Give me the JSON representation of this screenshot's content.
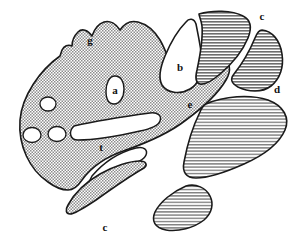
{
  "figure": {
    "background_color": "#ffffff",
    "outline_color": "#1a1a1a",
    "fill_light": "#b9b9b9",
    "fill_dark": "#9a9a9a",
    "label_color": "#111111",
    "width": 304,
    "height": 241
  },
  "labels": [
    {
      "id": "g",
      "text": "g",
      "x": 90,
      "y": 41,
      "note": "upper-left serrated margin"
    },
    {
      "id": "a",
      "text": "a",
      "x": 115,
      "y": 91,
      "note": "small pear-shaped lacuna in main body"
    },
    {
      "id": "b",
      "text": "b",
      "x": 180,
      "y": 68,
      "note": "large comma-shaped notch upper centre"
    },
    {
      "id": "c_top",
      "text": "c",
      "x": 262,
      "y": 17,
      "note": "upper-right detached lobe"
    },
    {
      "id": "d",
      "text": "d",
      "x": 277,
      "y": 90,
      "note": "right margin of upper-right lobe"
    },
    {
      "id": "e",
      "text": "e",
      "x": 190,
      "y": 105,
      "note": "central channel junction"
    },
    {
      "id": "t",
      "text": "t",
      "x": 101,
      "y": 148,
      "note": "between the two long white channels"
    },
    {
      "id": "c_bottom",
      "text": "c",
      "x": 105,
      "y": 228,
      "note": "lower detached lobe"
    }
  ],
  "regions": [
    {
      "id": "main-body",
      "fill": "light",
      "note": "large left mass with serrated dorsal margin"
    },
    {
      "id": "upper-centre-lobe",
      "fill": "dark",
      "note": "hatched lobe right of the b-notch"
    },
    {
      "id": "upper-right-lobe",
      "fill": "dark",
      "note": "crescent lobe labelled c / d"
    },
    {
      "id": "right-large-lobe",
      "fill": "dark",
      "note": "large lobe below e"
    },
    {
      "id": "lower-left-lobe",
      "fill": "light",
      "note": "small lobe lower left"
    },
    {
      "id": "lower-centre-lobe",
      "fill": "dark",
      "note": "lobe labelled c at bottom"
    }
  ],
  "lacunae": [
    {
      "id": "vesicle-1",
      "cx": 48,
      "cy": 104,
      "rx": 8,
      "ry": 7
    },
    {
      "id": "vesicle-2",
      "cx": 32,
      "cy": 135,
      "rx": 9,
      "ry": 7.5
    },
    {
      "id": "vesicle-3",
      "cx": 57,
      "cy": 134,
      "rx": 9,
      "ry": 7.5
    },
    {
      "id": "lacuna-a",
      "cx": 115,
      "cy": 90,
      "rx": 9,
      "ry": 14
    }
  ]
}
